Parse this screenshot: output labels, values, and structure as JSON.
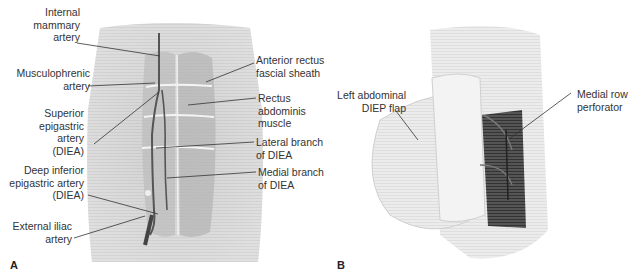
{
  "figure": {
    "panel_a": {
      "letter": "A",
      "labels_left": [
        {
          "id": "internal-mammary-artery",
          "text": "Internal\nmammary\nartery"
        },
        {
          "id": "musculophrenic-artery",
          "text": "Musculophrenic\nartery"
        },
        {
          "id": "superior-epigastric-artery",
          "text": "Superior\nepigastric\nartery\n(DIEA)"
        },
        {
          "id": "deep-inferior-epigastric-artery",
          "text": "Deep inferior\nepigastric artery\n(DIEA)"
        },
        {
          "id": "external-iliac-artery",
          "text": "External iliac\nartery"
        }
      ],
      "labels_right": [
        {
          "id": "anterior-rectus-fascial-sheath",
          "text": "Anterior rectus\nfascial sheath"
        },
        {
          "id": "rectus-abdominis-muscle",
          "text": "Rectus\nabdominis\nmuscle"
        },
        {
          "id": "lateral-branch-of-diea",
          "text": "Lateral branch\nof DIEA"
        },
        {
          "id": "medial-branch-of-diea",
          "text": "Medial branch\nof DIEA"
        }
      ]
    },
    "panel_b": {
      "letter": "B",
      "labels": [
        {
          "id": "left-abdominal-diep-flap",
          "text": "Left abdominal\nDIEP flap"
        },
        {
          "id": "medial-row-perforator",
          "text": "Medial row\nperforator"
        }
      ]
    }
  }
}
